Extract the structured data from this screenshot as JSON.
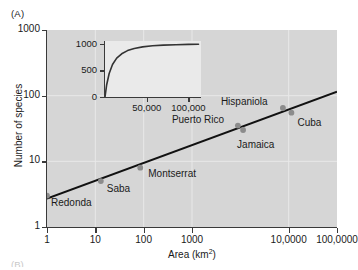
{
  "figure": {
    "panel_label": "(A)",
    "next_panel_label": "(B)"
  },
  "chart_data": {
    "type": "scatter",
    "title": "",
    "xlabel": "Area (km",
    "xlabel_sup": "2",
    "xlabel_close": ")",
    "xlabel_full": "Area (km2)",
    "ylabel": "Number of species",
    "xscale": "log",
    "yscale": "log",
    "xlim": [
      1,
      1000000
    ],
    "ylim": [
      1,
      1000
    ],
    "grid": true,
    "legend": "none",
    "xticks": [
      {
        "value": 1,
        "label": "1"
      },
      {
        "value": 10,
        "label": "10"
      },
      {
        "value": 100,
        "label": "100"
      },
      {
        "value": 1000,
        "label": "1000"
      },
      {
        "value": 100000,
        "label": "10,0000"
      },
      {
        "value": 1000000,
        "label": "100,0000"
      }
    ],
    "yticks": [
      {
        "value": 1,
        "label": "1"
      },
      {
        "value": 10,
        "label": "10"
      },
      {
        "value": 100,
        "label": "100"
      },
      {
        "value": 1000,
        "label": "1000"
      }
    ],
    "points": [
      {
        "name": "Redonda",
        "x": 1,
        "y": 3,
        "label": "Redonda",
        "label_dx": 4,
        "label_dy": 7
      },
      {
        "name": "Saba",
        "x": 13,
        "y": 5,
        "label": "Saba",
        "label_dx": 6,
        "label_dy": 8
      },
      {
        "name": "Montserrat",
        "x": 85,
        "y": 8,
        "label": "Montserrat",
        "label_dx": 8,
        "label_dy": 6
      },
      {
        "name": "Puerto Rico",
        "x": 8900,
        "y": 35,
        "label": "Puerto Rico",
        "label_dx": -66,
        "label_dy": -6
      },
      {
        "name": "Jamaica",
        "x": 11400,
        "y": 30,
        "label": "Jamaica",
        "label_dx": -6,
        "label_dy": 15
      },
      {
        "name": "Hispaniola",
        "x": 76000,
        "y": 65,
        "label": "Hispaniola",
        "label_dx": -62,
        "label_dy": -6
      },
      {
        "name": "Cuba",
        "x": 114000,
        "y": 55,
        "label": "Cuba",
        "label_dx": 6,
        "label_dy": 10
      }
    ],
    "fit_line": {
      "name": "regression-line",
      "x_start": 1,
      "y_start": 2.7,
      "x_end": 1000000,
      "y_end": 115
    },
    "marker_color": "#8c8c8c",
    "line_color": "#111111",
    "plot_background": "#d6d6d6",
    "gridline_color": "#e8e8e8"
  },
  "inset": {
    "type": "line",
    "xscale": "linear",
    "yscale": "linear",
    "xlim": [
      0,
      115000
    ],
    "ylim": [
      0,
      1050
    ],
    "grid": false,
    "background": "#eaeaea",
    "line_color": "#333333",
    "xticks": [
      {
        "value": 50000,
        "label": "50,000"
      },
      {
        "value": 100000,
        "label": "100,000"
      }
    ],
    "yticks": [
      {
        "value": 0,
        "label": "0"
      },
      {
        "value": 500,
        "label": "500"
      },
      {
        "value": 1000,
        "label": "1000"
      }
    ],
    "curve": {
      "x": [
        0,
        2000,
        5000,
        9000,
        14000,
        20000,
        27000,
        35000,
        45000,
        57000,
        70000,
        85000,
        100000,
        112000
      ],
      "y": [
        0,
        230,
        440,
        610,
        730,
        810,
        870,
        910,
        940,
        960,
        972,
        980,
        986,
        990
      ]
    }
  }
}
